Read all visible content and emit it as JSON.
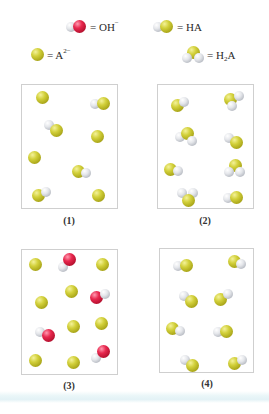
{
  "legend": {
    "hydroxide": {
      "symbol": "OH",
      "charge": "−",
      "prefix": "= "
    },
    "ha": {
      "symbol": "HA",
      "prefix": "= "
    },
    "a2": {
      "symbol": "A",
      "charge": "2−",
      "prefix": "= "
    },
    "h2a": {
      "symbol_h": "H",
      "subscript": "2",
      "symbol_a": "A",
      "prefix": "= "
    }
  },
  "panels": [
    {
      "label": "(1)",
      "contents": {
        "A2-": 4,
        "HA": 4
      }
    },
    {
      "label": "(2)",
      "contents": {
        "HA": 5,
        "H2A": 3
      }
    },
    {
      "label": "(3)",
      "contents": {
        "A2-": 8,
        "OH-": 4
      }
    },
    {
      "label": "(4)",
      "contents": {
        "HA": 8
      }
    }
  ],
  "colors": {
    "A_atom": "#c9c52c",
    "H_atom": "#e4e6ea",
    "O_atom": "#e0264a",
    "panel_border": "#cfcfcf"
  }
}
